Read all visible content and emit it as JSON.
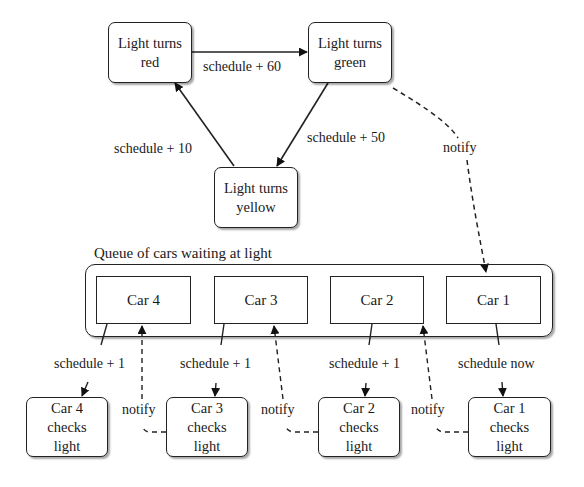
{
  "diagram": {
    "states": {
      "red": "Light turns\nred",
      "green": "Light turns\ngreen",
      "yellow": "Light turns\nyellow"
    },
    "transitions": {
      "red_to_green": "schedule + 60",
      "green_to_yellow": "schedule + 50",
      "yellow_to_red": "schedule + 10",
      "green_to_car1": "notify"
    },
    "queue": {
      "title": "Queue of cars waiting at light",
      "cars": [
        "Car 4",
        "Car 3",
        "Car 2",
        "Car 1"
      ]
    },
    "checks": [
      {
        "label": "Car 4\nchecks\nlight",
        "schedule": "schedule + 1",
        "notify": "notify"
      },
      {
        "label": "Car 3\nchecks\nlight",
        "schedule": "schedule + 1",
        "notify": "notify"
      },
      {
        "label": "Car 2\nchecks\nlight",
        "schedule": "schedule + 1",
        "notify": "notify"
      },
      {
        "label": "Car 1\nchecks\nlight",
        "schedule": "schedule now"
      }
    ],
    "colors": {
      "stroke": "#222222",
      "background": "#ffffff"
    }
  }
}
